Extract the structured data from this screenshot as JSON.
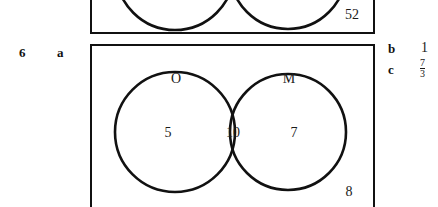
{
  "question": {
    "number": "6",
    "parts": {
      "a_label": "a",
      "b_label": "b",
      "c_label": "c"
    }
  },
  "answers": {
    "b": "1",
    "c_numerator": "7",
    "c_denominator": "3"
  },
  "previous_diagram": {
    "outside_count": "52"
  },
  "venn_diagram": {
    "left_set_name": "O",
    "right_set_name": "M",
    "left_only": "5",
    "intersection": "10",
    "right_only": "7",
    "outside": "8"
  },
  "colors": {
    "ink": "#111111",
    "page": "#ffffff"
  }
}
